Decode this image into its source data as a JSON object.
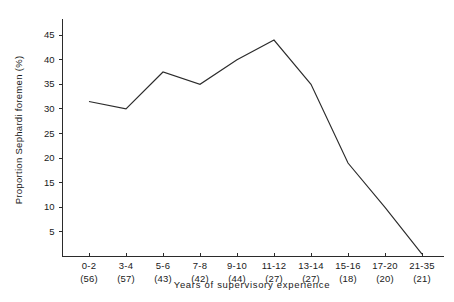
{
  "chart_data": {
    "type": "line",
    "title": "",
    "xlabel": "Years of supervisory experience",
    "ylabel": "Proportion Sephardi foremen (%)",
    "categories": [
      "0-2",
      "3-4",
      "5-6",
      "7-8",
      "9-10",
      "11-12",
      "13-14",
      "15-16",
      "17-20",
      "21-35"
    ],
    "category_counts": [
      "(56)",
      "(57)",
      "(43)",
      "(42)",
      "(44)",
      "(27)",
      "(27)",
      "(18)",
      "(20)",
      "(21)"
    ],
    "values": [
      31.5,
      30.0,
      37.5,
      35.0,
      40.0,
      44.0,
      35.0,
      19.0,
      10.0,
      0.5
    ],
    "ylim": [
      0,
      47
    ],
    "yticks": [
      5,
      10,
      15,
      20,
      25,
      30,
      35,
      40,
      45
    ],
    "ytick_labels": [
      "5",
      "10",
      "15",
      "20",
      "25",
      "30",
      "35",
      "40",
      "45"
    ],
    "grid": false,
    "legend": "none",
    "line_color": "#2b2b2b",
    "axis_color": "#2b2b2b",
    "background": "#ffffff"
  }
}
